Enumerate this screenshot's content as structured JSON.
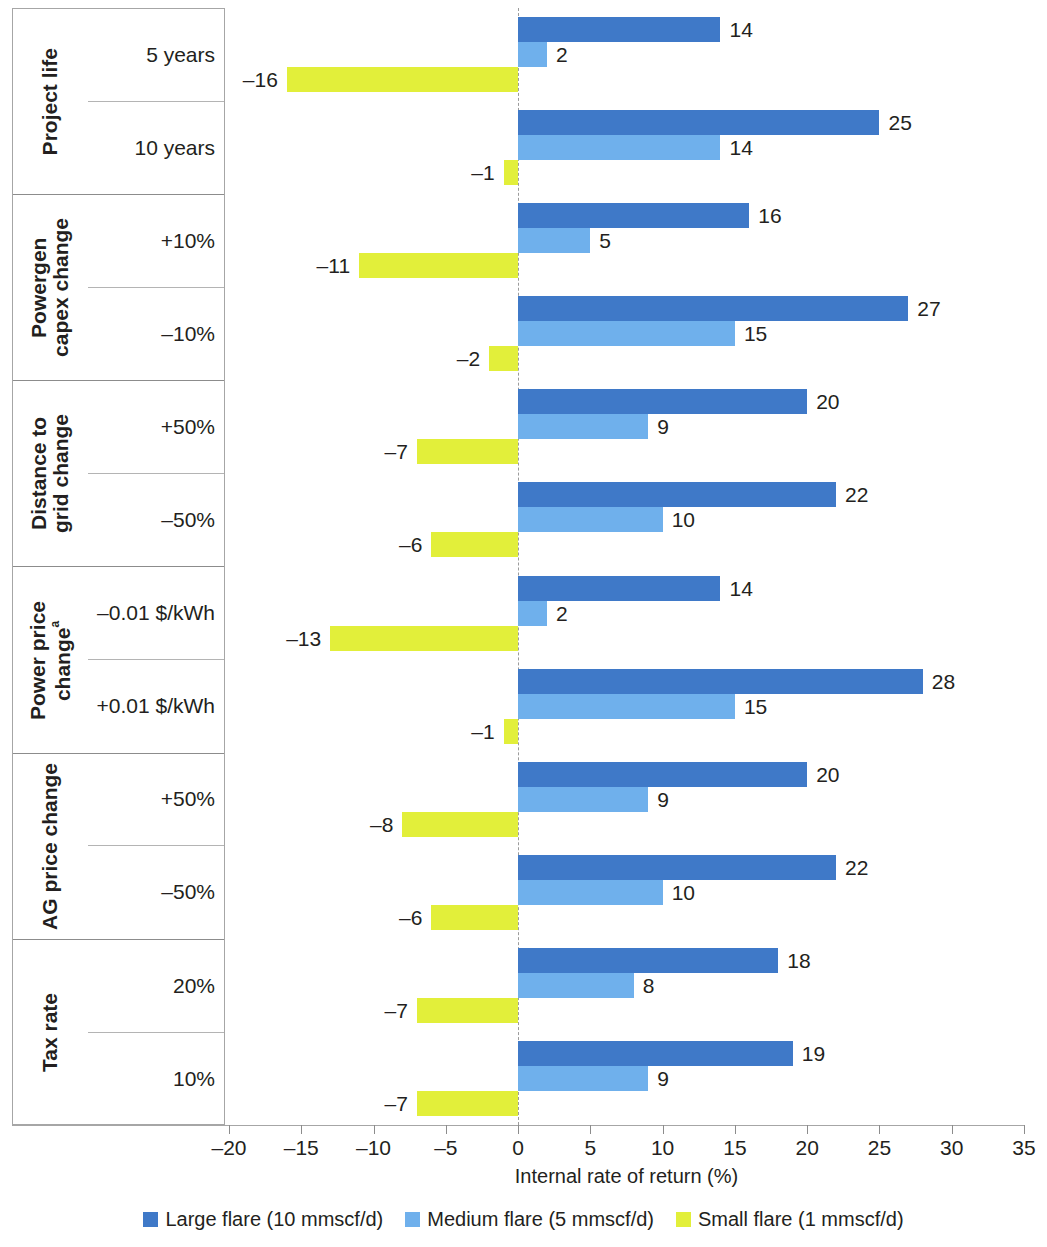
{
  "chart_data": {
    "type": "bar",
    "orientation": "horizontal",
    "title": "",
    "xlabel": "Internal rate of return (%)",
    "ylabel": "",
    "xlim": [
      -20,
      35
    ],
    "xticks": [
      -20,
      -15,
      -10,
      -5,
      0,
      5,
      10,
      15,
      20,
      25,
      30,
      35
    ],
    "xtick_labels": [
      "–20",
      "–15",
      "–10",
      "–5",
      "0",
      "5",
      "10",
      "15",
      "20",
      "25",
      "30",
      "35"
    ],
    "grid": false,
    "zero_reference_line": true,
    "legend_position": "bottom",
    "series": [
      {
        "name": "Large flare (10 mmscf/d)",
        "color": "#3f79c8",
        "values": [
          14,
          25,
          16,
          27,
          20,
          22,
          14,
          28,
          20,
          22,
          18,
          19
        ]
      },
      {
        "name": "Medium flare (5 mmscf/d)",
        "color": "#6fb0ec",
        "values": [
          2,
          14,
          5,
          15,
          9,
          10,
          2,
          15,
          9,
          10,
          8,
          9
        ]
      },
      {
        "name": "Small flare (1 mmscf/d)",
        "color": "#e2ef3a",
        "values": [
          -16,
          -1,
          -11,
          -2,
          -7,
          -6,
          -13,
          -1,
          -8,
          -6,
          -7,
          -7
        ]
      }
    ],
    "categories": [
      "Project life — 5 years",
      "Project life — 10 years",
      "Powergen capex change — +10%",
      "Powergen capex change — −10%",
      "Distance to grid change — +50%",
      "Distance to grid change — −50%",
      "Power price change — −0.01 $/kWh",
      "Power price change — +0.01 $/kWh",
      "AG price change — +50%",
      "AG price change — −50%",
      "Tax rate — 20%",
      "Tax rate — 10%"
    ],
    "groups": [
      {
        "name": "Project life",
        "name_lines": "Project life",
        "superscript": "",
        "rows": [
          {
            "label": "5 years",
            "large": 14,
            "medium": 2,
            "small": -16,
            "large_text": "14",
            "medium_text": "2",
            "small_text": "–16"
          },
          {
            "label": "10 years",
            "large": 25,
            "medium": 14,
            "small": -1,
            "large_text": "25",
            "medium_text": "14",
            "small_text": "–1"
          }
        ]
      },
      {
        "name": "Powergen capex change",
        "name_lines": "Powergen\ncapex change",
        "superscript": "",
        "rows": [
          {
            "label": "+10%",
            "large": 16,
            "medium": 5,
            "small": -11,
            "large_text": "16",
            "medium_text": "5",
            "small_text": "–11"
          },
          {
            "label": "–10%",
            "large": 27,
            "medium": 15,
            "small": -2,
            "large_text": "27",
            "medium_text": "15",
            "small_text": "–2"
          }
        ]
      },
      {
        "name": "Distance to grid change",
        "name_lines": "Distance to\ngrid change",
        "superscript": "",
        "rows": [
          {
            "label": "+50%",
            "large": 20,
            "medium": 9,
            "small": -7,
            "large_text": "20",
            "medium_text": "9",
            "small_text": "–7"
          },
          {
            "label": "–50%",
            "large": 22,
            "medium": 10,
            "small": -6,
            "large_text": "22",
            "medium_text": "10",
            "small_text": "–6"
          }
        ]
      },
      {
        "name": "Power price change",
        "name_lines": "Power price\nchange",
        "superscript": "a",
        "rows": [
          {
            "label": "–0.01 $/kWh",
            "large": 14,
            "medium": 2,
            "small": -13,
            "large_text": "14",
            "medium_text": "2",
            "small_text": "–13"
          },
          {
            "label": "+0.01 $/kWh",
            "large": 28,
            "medium": 15,
            "small": -1,
            "large_text": "28",
            "medium_text": "15",
            "small_text": "–1"
          }
        ]
      },
      {
        "name": "AG price change",
        "name_lines": "AG price change",
        "superscript": "",
        "rows": [
          {
            "label": "+50%",
            "large": 20,
            "medium": 9,
            "small": -8,
            "large_text": "20",
            "medium_text": "9",
            "small_text": "–8"
          },
          {
            "label": "–50%",
            "large": 22,
            "medium": 10,
            "small": -6,
            "large_text": "22",
            "medium_text": "10",
            "small_text": "–6"
          }
        ]
      },
      {
        "name": "Tax rate",
        "name_lines": "Tax rate",
        "superscript": "",
        "rows": [
          {
            "label": "20%",
            "large": 18,
            "medium": 8,
            "small": -7,
            "large_text": "18",
            "medium_text": "8",
            "small_text": "–7"
          },
          {
            "label": "10%",
            "large": 19,
            "medium": 9,
            "small": -7,
            "large_text": "19",
            "medium_text": "9",
            "small_text": "–7"
          }
        ]
      }
    ],
    "legend": [
      {
        "label": "Large flare (10 mmscf/d)",
        "color": "#3f79c8"
      },
      {
        "label": "Medium flare (5 mmscf/d)",
        "color": "#6fb0ec"
      },
      {
        "label": "Small flare (1 mmscf/d)",
        "color": "#e2ef3a"
      }
    ]
  }
}
